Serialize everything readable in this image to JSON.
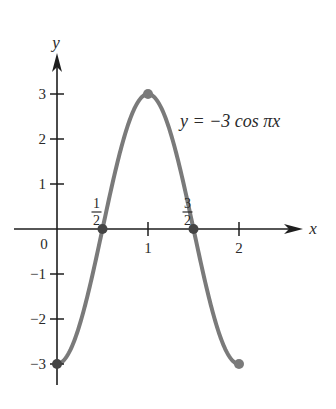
{
  "chart_data": {
    "type": "line",
    "title": "",
    "equation": "y = −3 cos πx",
    "xlabel": "x",
    "ylabel": "y",
    "xlim": [
      0,
      2
    ],
    "ylim": [
      -3,
      3
    ],
    "grid": false,
    "x_ticks": [
      {
        "value": 0.5,
        "label_num": "1",
        "label_den": "2"
      },
      {
        "value": 1,
        "label": "1"
      },
      {
        "value": 1.5,
        "label_num": "3",
        "label_den": "2"
      },
      {
        "value": 2,
        "label": "2"
      }
    ],
    "y_ticks": [
      {
        "value": 3,
        "label": "3"
      },
      {
        "value": 2,
        "label": "2"
      },
      {
        "value": 1,
        "label": "1"
      },
      {
        "value": -1,
        "label": "−1"
      },
      {
        "value": -2,
        "label": "−2"
      },
      {
        "value": -3,
        "label": "−3"
      }
    ],
    "origin_label": "0",
    "series": [
      {
        "name": "y = −3 cos πx",
        "x": [
          0,
          0.25,
          0.5,
          0.75,
          1,
          1.25,
          1.5,
          1.75,
          2
        ],
        "y": [
          -3,
          -2.12,
          0,
          2.12,
          3,
          2.12,
          0,
          -2.12,
          -3
        ]
      }
    ],
    "highlighted_points": [
      {
        "x": 0,
        "y": -3
      },
      {
        "x": 0.5,
        "y": 0
      },
      {
        "x": 1,
        "y": 3
      },
      {
        "x": 1.5,
        "y": 0
      },
      {
        "x": 2,
        "y": -3
      }
    ],
    "colors": {
      "curve": "#7a7a7a",
      "axis": "#1e1e1e",
      "text": "#2a2a2a"
    }
  }
}
